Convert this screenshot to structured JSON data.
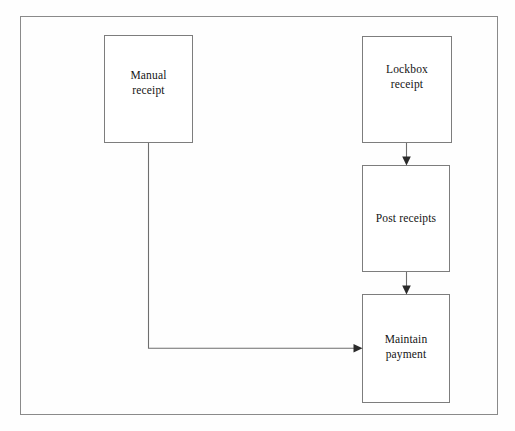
{
  "diagram": {
    "background_color": "#fefefe",
    "frame_border_color": "#8a8a8a",
    "node_border_color": "#7d7d7d",
    "connector_color": "#6e6e6e",
    "arrow_color": "#2a2a2a",
    "nodes": [
      {
        "id": "manual-receipt",
        "label": "Manual\nreceipt"
      },
      {
        "id": "lockbox-receipt",
        "label": "Lockbox\nreceipt"
      },
      {
        "id": "post-receipts",
        "label": "Post receipts"
      },
      {
        "id": "maintain-payment",
        "label": "Maintain\npayment"
      }
    ],
    "connectors": [
      {
        "id": "lockbox-to-post",
        "from": "lockbox-receipt",
        "to": "post-receipts",
        "direction": "down"
      },
      {
        "id": "post-to-maintain",
        "from": "post-receipts",
        "to": "maintain-payment",
        "direction": "down"
      },
      {
        "id": "manual-to-maintain",
        "from": "manual-receipt",
        "to": "maintain-payment",
        "direction": "down-then-right"
      }
    ]
  }
}
